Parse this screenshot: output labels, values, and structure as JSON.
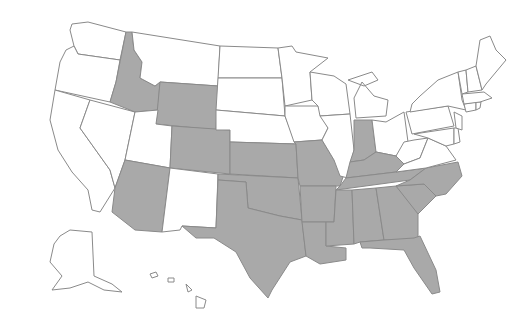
{
  "map": {
    "title": "",
    "colors": {
      "shaded": "#a9a9a9",
      "unshaded": "#ffffff",
      "border": "#8a8a8a"
    },
    "shaded_states": [
      "ID",
      "WY",
      "CO",
      "AZ",
      "KS",
      "OK",
      "TX",
      "MO",
      "AR",
      "LA",
      "IN",
      "KY",
      "TN",
      "MS",
      "AL",
      "GA",
      "FL",
      "SC",
      "NC"
    ],
    "unshaded_states": [
      "WA",
      "OR",
      "CA",
      "NV",
      "UT",
      "MT",
      "ND",
      "SD",
      "NE",
      "NM",
      "MN",
      "IA",
      "WI",
      "IL",
      "MI",
      "OH",
      "PA",
      "NY",
      "VT",
      "NH",
      "ME",
      "MA",
      "CT",
      "RI",
      "NJ",
      "DE",
      "MD",
      "VA",
      "WV",
      "AK",
      "HI"
    ]
  }
}
